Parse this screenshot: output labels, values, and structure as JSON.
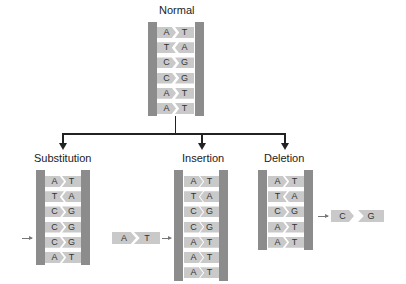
{
  "titles": {
    "normal": "Normal",
    "substitution": "Substitution",
    "insertion": "Insertion",
    "deletion": "Deletion"
  },
  "colors": {
    "rail": "#8c8c8c",
    "base": "#c9c9c9",
    "connector": "#222222",
    "pointer_arrow": "#777777"
  },
  "normal": {
    "pairs": [
      [
        "A",
        "T"
      ],
      [
        "T",
        "A"
      ],
      [
        "C",
        "G"
      ],
      [
        "C",
        "G"
      ],
      [
        "A",
        "T"
      ],
      [
        "A",
        "T"
      ]
    ]
  },
  "substitution": {
    "pairs": [
      [
        "A",
        "T"
      ],
      [
        "T",
        "A"
      ],
      [
        "C",
        "G"
      ],
      [
        "C",
        "G"
      ],
      [
        "C",
        "G"
      ],
      [
        "A",
        "T"
      ]
    ],
    "changed_row_index": 4
  },
  "insertion": {
    "pairs": [
      [
        "A",
        "T"
      ],
      [
        "T",
        "A"
      ],
      [
        "C",
        "G"
      ],
      [
        "C",
        "G"
      ],
      [
        "A",
        "T"
      ],
      [
        "A",
        "T"
      ],
      [
        "A",
        "T"
      ]
    ],
    "inserted_pair": [
      "A",
      "T"
    ],
    "inserted_row_index": 4
  },
  "deletion": {
    "pairs": [
      [
        "A",
        "T"
      ],
      [
        "T",
        "A"
      ],
      [
        "C",
        "G"
      ],
      [
        "A",
        "T"
      ],
      [
        "A",
        "T"
      ]
    ],
    "deleted_pair": [
      "C",
      "G"
    ]
  }
}
